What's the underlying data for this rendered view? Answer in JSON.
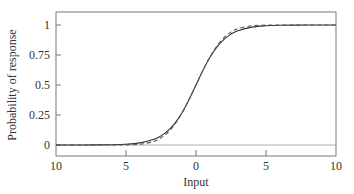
{
  "chart_data": {
    "type": "line",
    "title": "",
    "xlabel": "Input",
    "ylabel": "Probability of response",
    "xlim": [
      -10,
      10
    ],
    "ylim": [
      -0.125,
      1.09
    ],
    "grid": false,
    "legend": null,
    "x_ticks": [
      -10,
      -5,
      0,
      5,
      10
    ],
    "x_tick_labels": [
      "10",
      "5",
      "0",
      "5",
      "10"
    ],
    "y_ticks": [
      0,
      0.25,
      0.5,
      0.75,
      1
    ],
    "y_tick_labels": [
      "0",
      "0.25",
      "0.5",
      "0.75",
      "1"
    ],
    "x": [
      -10,
      -8,
      -6,
      -5,
      -4,
      -3,
      -2.5,
      -2,
      -1.5,
      -1,
      -0.5,
      0,
      0.5,
      1,
      1.5,
      2,
      2.5,
      3,
      4,
      5,
      6,
      8,
      10
    ],
    "series": [
      {
        "name": "logistic",
        "style": "solid",
        "values": [
          4.54e-05,
          0.000335,
          0.00247,
          0.00669,
          0.018,
          0.0474,
          0.0759,
          0.1192,
          0.1824,
          0.2689,
          0.3775,
          0.5,
          0.6225,
          0.7311,
          0.8176,
          0.8808,
          0.9241,
          0.9526,
          0.982,
          0.9933,
          0.9975,
          0.9997,
          1.0
        ]
      },
      {
        "name": "probit",
        "style": "dashed",
        "values": [
          0.0,
          0.0,
          0.0001,
          0.0009,
          0.0062,
          0.0304,
          0.0591,
          0.1056,
          0.1743,
          0.266,
          0.3773,
          0.5,
          0.6227,
          0.734,
          0.8257,
          0.8944,
          0.9409,
          0.9696,
          0.9938,
          0.9991,
          0.9999,
          1.0,
          1.0
        ]
      }
    ]
  }
}
